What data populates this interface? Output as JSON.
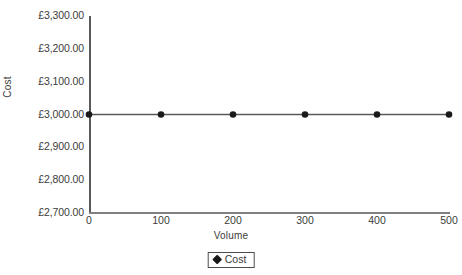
{
  "chart_data": {
    "type": "line",
    "title": "",
    "xlabel": "Volume",
    "ylabel": "Cost",
    "x": [
      0,
      100,
      200,
      300,
      400,
      500
    ],
    "xticklabels": [
      "0",
      "100",
      "200",
      "300",
      "400",
      "500"
    ],
    "xlim": [
      0,
      500
    ],
    "yticklabels": [
      "£3,300.00",
      "£3,200.00",
      "£3,100.00",
      "£3,000.00",
      "£2,900.00",
      "£2,800.00",
      "£2,700.00"
    ],
    "yticks": [
      3300,
      3200,
      3100,
      3000,
      2900,
      2800,
      2700
    ],
    "ylim": [
      2700,
      3300
    ],
    "grid": false,
    "legend_position": "bottom-center",
    "series": [
      {
        "name": "Cost",
        "values": [
          3000,
          3000,
          3000,
          3000,
          3000,
          3000
        ],
        "color": "#595959",
        "marker": "circle",
        "marker_color": "#1a1a1a"
      }
    ]
  },
  "legend": {
    "entries": [
      {
        "label": "Cost",
        "marker": "diamond-marker"
      }
    ]
  },
  "colors": {
    "axis": "#595959",
    "axis_x": "#808080",
    "line": "#595959",
    "marker": "#1a1a1a",
    "text": "#3c3c3c",
    "background": "#ffffff"
  }
}
